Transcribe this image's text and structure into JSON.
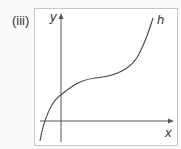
{
  "part_label": "(iii)",
  "graph": {
    "x_axis_label": "x",
    "y_axis_label": "y",
    "curve_label": "h",
    "curve_color": "#444444",
    "axis_color": "#555555"
  }
}
